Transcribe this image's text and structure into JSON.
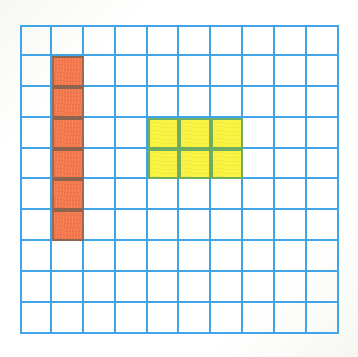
{
  "figure": {
    "kind": "grid-worksheet",
    "title": "",
    "background_color": "#fefefc"
  },
  "grid": {
    "columns": 10,
    "rows": 10,
    "line_color": "#3fa5e8",
    "line_width_px": 2,
    "cell_width_px": 31.9,
    "cell_height_px": 30.9,
    "left_px": 20,
    "top_px": 25,
    "width_px": 319,
    "height_px": 309,
    "cell_background": "#ffffff"
  },
  "shapes": [
    {
      "name": "orange-column",
      "label": "orange vertical strip",
      "color": "#f4764a",
      "border_color": "#8d6450",
      "columns": [
        2
      ],
      "rows": [
        2,
        3,
        4,
        5,
        6,
        7
      ],
      "count": 6,
      "shape_width_cells": 1,
      "shape_height_cells": 6
    },
    {
      "name": "yellow-rectangle",
      "label": "yellow rectangle",
      "color": "#faf33c",
      "border_color": "#6fae62",
      "columns": [
        5,
        6,
        7
      ],
      "rows": [
        4,
        5
      ],
      "count": 6,
      "shape_width_cells": 3,
      "shape_height_cells": 2
    }
  ],
  "cells": {
    "orange": [
      [
        2,
        2
      ],
      [
        2,
        3
      ],
      [
        2,
        4
      ],
      [
        2,
        5
      ],
      [
        2,
        6
      ],
      [
        2,
        7
      ]
    ],
    "yellow": [
      [
        5,
        4
      ],
      [
        6,
        4
      ],
      [
        7,
        4
      ],
      [
        5,
        5
      ],
      [
        6,
        5
      ],
      [
        7,
        5
      ]
    ]
  },
  "colors": {
    "grid_line": "#3fa5e8",
    "orange_fill": "#f4764a",
    "orange_edge": "#8d6450",
    "yellow_fill": "#faf33c",
    "yellow_edge": "#6fae62",
    "page": "#fefefc"
  }
}
